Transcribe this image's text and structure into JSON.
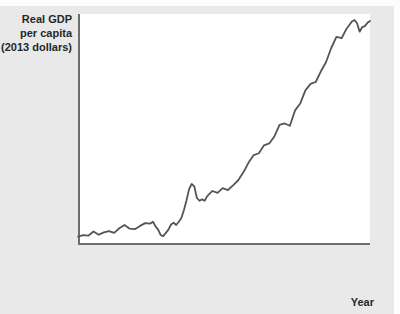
{
  "figure": {
    "background_color": "#e9e9e9",
    "plot_background_color": "#ffffff",
    "axis_color": "#6d6d6d",
    "line_color": "#555555"
  },
  "chart_data": {
    "type": "line",
    "title": "Real GDP per capita (2013 dollars)",
    "title_lines": [
      "Real GDP",
      "per capita",
      "(2013 dollars)"
    ],
    "xlabel": "Year",
    "ylabel": "Real GDP per capita (2013 dollars)",
    "xlim": [
      1900,
      2013
    ],
    "ylim": [
      5400,
      55000
    ],
    "grid": false,
    "legend": "none",
    "y_ticks": [
      10000,
      20000,
      30000,
      40000,
      50000
    ],
    "y_tick_labels": [
      "10,000",
      "20,000",
      "30,000",
      "40,000",
      "$50,000"
    ],
    "x_ticks": [
      1900,
      1910,
      1920,
      1930,
      1940,
      1950,
      1960,
      1970,
      1980,
      1990,
      2000,
      2010,
      2013
    ],
    "x_tick_labels": [
      "1900",
      "1910",
      "1920",
      "1930",
      "1940",
      "1950",
      "1960",
      "1970",
      "1980",
      "1990",
      "2000",
      "2010",
      "2013"
    ],
    "x": [
      1900,
      1902,
      1904,
      1906,
      1908,
      1910,
      1912,
      1914,
      1916,
      1918,
      1920,
      1922,
      1924,
      1926,
      1928,
      1929,
      1930,
      1931,
      1932,
      1933,
      1934,
      1935,
      1936,
      1937,
      1938,
      1939,
      1940,
      1941,
      1942,
      1943,
      1944,
      1945,
      1946,
      1947,
      1948,
      1949,
      1950,
      1952,
      1954,
      1956,
      1958,
      1960,
      1962,
      1964,
      1966,
      1968,
      1970,
      1972,
      1974,
      1976,
      1978,
      1980,
      1982,
      1984,
      1986,
      1988,
      1990,
      1992,
      1994,
      1996,
      1998,
      2000,
      2002,
      2004,
      2006,
      2007,
      2008,
      2009,
      2010,
      2011,
      2012,
      2013
    ],
    "values": [
      7200,
      7500,
      7400,
      8300,
      7600,
      8100,
      8400,
      8000,
      9000,
      9700,
      8900,
      8800,
      9500,
      10100,
      10000,
      10400,
      9400,
      8700,
      7500,
      7300,
      8000,
      8700,
      9800,
      10200,
      9700,
      10400,
      11200,
      12900,
      15000,
      17400,
      18500,
      18000,
      15500,
      14900,
      15200,
      14900,
      15900,
      17000,
      16600,
      17600,
      17200,
      18200,
      19300,
      21000,
      23100,
      24700,
      25100,
      26800,
      27200,
      28700,
      31200,
      31500,
      31000,
      34300,
      35800,
      38600,
      40000,
      40400,
      42700,
      44700,
      47700,
      50100,
      49800,
      51900,
      53400,
      53700,
      53000,
      51200,
      52200,
      52400,
      53100,
      53500
    ]
  }
}
